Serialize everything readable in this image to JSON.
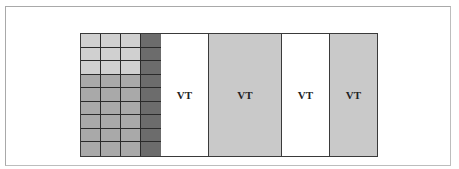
{
  "diagram": {
    "grid": {
      "rows": 9,
      "cols": 4,
      "row_shades": [
        "light",
        "light",
        "light",
        "med",
        "med",
        "med",
        "med",
        "med",
        "med"
      ],
      "last_col_shade": "dark"
    },
    "columns": [
      {
        "label": "VT",
        "fill": "#ffffff",
        "width": 48
      },
      {
        "label": "VT",
        "fill": "#c9c9c9",
        "width": 73
      },
      {
        "label": "VT",
        "fill": "#ffffff",
        "width": 48
      },
      {
        "label": "VT",
        "fill": "#c9c9c9",
        "width": 48
      }
    ]
  }
}
